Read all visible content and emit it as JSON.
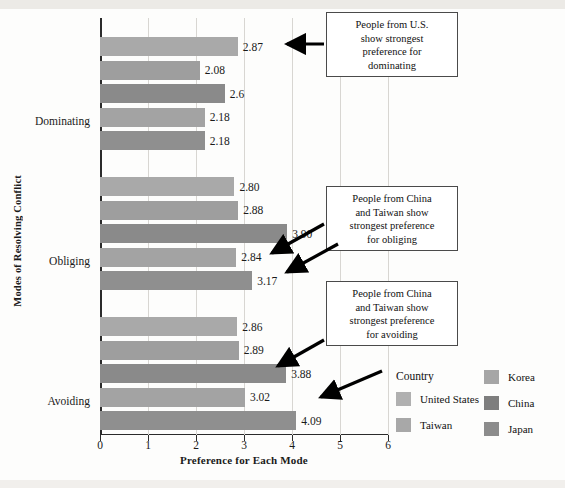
{
  "chart_data": {
    "type": "bar",
    "orientation": "horizontal",
    "title": "",
    "xlabel": "Preference for Each Mode",
    "ylabel": "Modes of Resolving Conflict",
    "xlim": [
      0,
      6
    ],
    "xticks": [
      "0",
      "1",
      "2",
      "3",
      "4",
      "5",
      "6"
    ],
    "grid": true,
    "categories": [
      "Dominating",
      "Obliging",
      "Avoiding"
    ],
    "series": [
      {
        "name": "United States",
        "color": "#a9a9a9",
        "values": [
          2.87,
          2.8,
          2.86
        ],
        "labels": [
          "2.87",
          "2.80",
          "2.86"
        ]
      },
      {
        "name": "Taiwan",
        "color": "#9e9e9e",
        "values": [
          2.08,
          2.88,
          2.89
        ],
        "labels": [
          "2.08",
          "2.88",
          "2.89"
        ]
      },
      {
        "name": "Korea",
        "color": "#8a8a8a",
        "values": [
          2.6,
          3.9,
          3.88
        ],
        "labels": [
          "2.6",
          "3.90",
          "3.88"
        ]
      },
      {
        "name": "China",
        "color": "#a3a3a3",
        "values": [
          2.18,
          2.84,
          3.02
        ],
        "labels": [
          "2.18",
          "2.84",
          "3.02"
        ]
      },
      {
        "name": "Japan",
        "color": "#8f8f8f",
        "values": [
          2.18,
          3.17,
          4.09
        ],
        "labels": [
          "2.18",
          "3.17",
          "4.09"
        ]
      }
    ],
    "legend": {
      "title": "Country",
      "position": "bottom-right",
      "entries": [
        {
          "label": "United States",
          "color": "#b0b0b0"
        },
        {
          "label": "Taiwan",
          "color": "#a8a8a8"
        },
        {
          "label": "Korea",
          "color": "#a6a6a6"
        },
        {
          "label": "China",
          "color": "#7e7e7e"
        },
        {
          "label": "Japan",
          "color": "#8c8c8c"
        }
      ]
    },
    "annotations": [
      {
        "id": "ann-dominating",
        "text": "People from U.S. show strongest preference for dominating"
      },
      {
        "id": "ann-obliging",
        "text": "People from China and Taiwan show strongest preference for obliging"
      },
      {
        "id": "ann-avoiding",
        "text": "People from China and Taiwan show strongest preference for avoiding"
      }
    ]
  },
  "annotation_lines": {
    "dominating": [
      "People from U.S.",
      "show strongest",
      "preference for",
      "dominating"
    ],
    "obliging": [
      "People from China",
      "and Taiwan show",
      "strongest preference",
      "for obliging"
    ],
    "avoiding": [
      "People from China",
      "and Taiwan show",
      "strongest preference",
      "for avoiding"
    ]
  }
}
